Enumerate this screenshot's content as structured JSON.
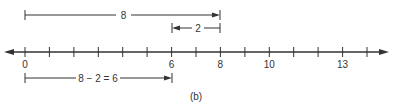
{
  "figure": {
    "caption": "(b)",
    "colors": {
      "ink": "#333333",
      "background": "#ffffff"
    }
  },
  "number_line": {
    "min_tick": 0,
    "max_tick": 14,
    "labels": [
      {
        "value": 0,
        "text": "0"
      },
      {
        "value": 6,
        "text": "6"
      },
      {
        "value": 8,
        "text": "8"
      },
      {
        "value": 10,
        "text": "10"
      },
      {
        "value": 13,
        "text": "13"
      }
    ]
  },
  "segments": {
    "top": {
      "from": 0,
      "to": 8,
      "label": "8"
    },
    "middle": {
      "from": 8,
      "to": 6,
      "label": "2"
    },
    "bottom": {
      "from": 0,
      "to": 6,
      "label": "8 − 2 = 6"
    }
  }
}
